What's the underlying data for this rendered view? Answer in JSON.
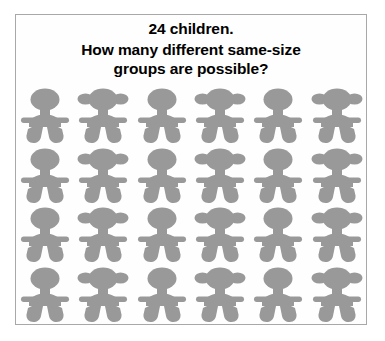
{
  "page": {
    "background_color": "#ffffff",
    "card_background": "#fefefe",
    "card_border_color": "#a8a8a8"
  },
  "prompt": {
    "line1": "24 children.",
    "line2": "How many different same-size",
    "line3": "groups are possible?",
    "text_color": "#000000"
  },
  "figures": {
    "icon_name": "child-figure-icon",
    "fill_color": "#999999",
    "columns": 6,
    "rows": 4,
    "total": 24,
    "variants": [
      "plain",
      "pigtails"
    ],
    "pattern": [
      [
        "plain",
        "pigtails",
        "plain",
        "pigtails",
        "plain",
        "pigtails"
      ],
      [
        "plain",
        "pigtails",
        "plain",
        "pigtails",
        "plain",
        "pigtails"
      ],
      [
        "plain",
        "pigtails",
        "plain",
        "pigtails",
        "plain",
        "pigtails"
      ],
      [
        "plain",
        "pigtails",
        "plain",
        "pigtails",
        "plain",
        "pigtails"
      ]
    ]
  }
}
